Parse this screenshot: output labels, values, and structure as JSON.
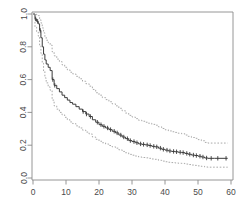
{
  "chart_data": {
    "type": "line",
    "title": "",
    "subtitle": "",
    "xlabel": "",
    "ylabel": "",
    "xlim": [
      0,
      61
    ],
    "ylim": [
      0,
      1.0
    ],
    "grid": false,
    "legend": null,
    "x_ticks": [
      0,
      10,
      20,
      30,
      40,
      50,
      60
    ],
    "x_tick_labels": [
      "0",
      "10",
      "20",
      "30",
      "40",
      "50",
      "60"
    ],
    "y_ticks": [
      0.0,
      0.2,
      0.4,
      0.6,
      0.8,
      1.0
    ],
    "y_tick_labels": [
      "0.0",
      "0.2",
      "0.4",
      "0.6",
      "0.8",
      "1.0"
    ],
    "series": [
      {
        "name": "survival-estimate",
        "style": "step-solid",
        "color": "#3a3a3a",
        "points": [
          [
            0,
            1.0
          ],
          [
            0.6,
            0.97
          ],
          [
            1.1,
            0.955
          ],
          [
            1.6,
            0.94
          ],
          [
            2.0,
            0.9
          ],
          [
            2.4,
            0.855
          ],
          [
            2.8,
            0.8
          ],
          [
            3.2,
            0.755
          ],
          [
            3.6,
            0.72
          ],
          [
            4.0,
            0.695
          ],
          [
            4.6,
            0.675
          ],
          [
            5.2,
            0.655
          ],
          [
            5.8,
            0.6
          ],
          [
            6.4,
            0.565
          ],
          [
            7.2,
            0.545
          ],
          [
            8.0,
            0.525
          ],
          [
            8.8,
            0.505
          ],
          [
            9.6,
            0.49
          ],
          [
            10.4,
            0.475
          ],
          [
            11.2,
            0.46
          ],
          [
            12.0,
            0.45
          ],
          [
            13.0,
            0.435
          ],
          [
            14.0,
            0.42
          ],
          [
            15.0,
            0.405
          ],
          [
            16.0,
            0.39
          ],
          [
            17.0,
            0.375
          ],
          [
            18.0,
            0.355
          ],
          [
            19.0,
            0.34
          ],
          [
            20.0,
            0.325
          ],
          [
            21.0,
            0.315
          ],
          [
            22.0,
            0.305
          ],
          [
            23.0,
            0.295
          ],
          [
            24.0,
            0.285
          ],
          [
            25.0,
            0.275
          ],
          [
            26.0,
            0.262
          ],
          [
            27.0,
            0.25
          ],
          [
            28.0,
            0.24
          ],
          [
            29.0,
            0.228
          ],
          [
            30.0,
            0.222
          ],
          [
            31.0,
            0.215
          ],
          [
            32.0,
            0.208
          ],
          [
            33.0,
            0.205
          ],
          [
            34.0,
            0.202
          ],
          [
            35.0,
            0.198
          ],
          [
            36.0,
            0.193
          ],
          [
            37.0,
            0.19
          ],
          [
            38.0,
            0.182
          ],
          [
            39.0,
            0.175
          ],
          [
            40.0,
            0.17
          ],
          [
            41.0,
            0.165
          ],
          [
            42.0,
            0.162
          ],
          [
            43.0,
            0.16
          ],
          [
            44.0,
            0.157
          ],
          [
            45.0,
            0.155
          ],
          [
            46.0,
            0.15
          ],
          [
            47.0,
            0.145
          ],
          [
            48.0,
            0.14
          ],
          [
            49.0,
            0.137
          ],
          [
            50.0,
            0.133
          ],
          [
            51.0,
            0.128
          ],
          [
            52.0,
            0.122
          ],
          [
            53.0,
            0.12
          ],
          [
            55.0,
            0.12
          ],
          [
            59.0,
            0.12
          ]
        ],
        "censor_points": [
          [
            0.8,
            0.97
          ],
          [
            1.4,
            0.955
          ],
          [
            2.2,
            0.9
          ],
          [
            6.0,
            0.6
          ],
          [
            6.6,
            0.565
          ],
          [
            15.2,
            0.405
          ],
          [
            16.2,
            0.39
          ],
          [
            17.4,
            0.375
          ],
          [
            19.5,
            0.34
          ],
          [
            20.6,
            0.325
          ],
          [
            21.5,
            0.315
          ],
          [
            22.6,
            0.305
          ],
          [
            23.5,
            0.295
          ],
          [
            24.6,
            0.285
          ],
          [
            25.5,
            0.275
          ],
          [
            26.6,
            0.262
          ],
          [
            27.5,
            0.25
          ],
          [
            28.6,
            0.24
          ],
          [
            29.5,
            0.228
          ],
          [
            30.6,
            0.222
          ],
          [
            31.5,
            0.215
          ],
          [
            32.6,
            0.208
          ],
          [
            33.5,
            0.205
          ],
          [
            34.6,
            0.202
          ],
          [
            35.5,
            0.198
          ],
          [
            36.6,
            0.193
          ],
          [
            37.5,
            0.19
          ],
          [
            38.6,
            0.182
          ],
          [
            39.5,
            0.175
          ],
          [
            40.6,
            0.17
          ],
          [
            41.5,
            0.165
          ],
          [
            42.6,
            0.162
          ],
          [
            43.5,
            0.16
          ],
          [
            44.6,
            0.157
          ],
          [
            45.5,
            0.155
          ],
          [
            46.6,
            0.15
          ],
          [
            47.5,
            0.145
          ],
          [
            48.6,
            0.14
          ],
          [
            49.5,
            0.137
          ],
          [
            50.6,
            0.133
          ],
          [
            51.5,
            0.128
          ],
          [
            52.6,
            0.122
          ],
          [
            54.0,
            0.12
          ],
          [
            56.0,
            0.12
          ],
          [
            58.5,
            0.12
          ]
        ]
      },
      {
        "name": "upper-confidence-limit",
        "style": "step-dashed",
        "color": "#9a9a9a",
        "points": [
          [
            0,
            1.0
          ],
          [
            0.6,
            1.0
          ],
          [
            1.1,
            0.995
          ],
          [
            1.6,
            0.99
          ],
          [
            2.0,
            0.965
          ],
          [
            2.4,
            0.945
          ],
          [
            2.8,
            0.915
          ],
          [
            3.2,
            0.885
          ],
          [
            3.6,
            0.86
          ],
          [
            4.0,
            0.84
          ],
          [
            4.6,
            0.825
          ],
          [
            5.2,
            0.81
          ],
          [
            5.8,
            0.77
          ],
          [
            6.4,
            0.745
          ],
          [
            7.2,
            0.725
          ],
          [
            8.0,
            0.71
          ],
          [
            8.8,
            0.69
          ],
          [
            9.6,
            0.675
          ],
          [
            10.4,
            0.66
          ],
          [
            11.2,
            0.645
          ],
          [
            12.0,
            0.635
          ],
          [
            13.0,
            0.62
          ],
          [
            14.0,
            0.605
          ],
          [
            15.0,
            0.59
          ],
          [
            16.0,
            0.575
          ],
          [
            17.0,
            0.56
          ],
          [
            18.0,
            0.54
          ],
          [
            19.0,
            0.52
          ],
          [
            20.0,
            0.505
          ],
          [
            21.0,
            0.49
          ],
          [
            22.0,
            0.478
          ],
          [
            23.0,
            0.465
          ],
          [
            24.0,
            0.452
          ],
          [
            25.0,
            0.44
          ],
          [
            26.0,
            0.425
          ],
          [
            27.0,
            0.41
          ],
          [
            28.0,
            0.396
          ],
          [
            29.0,
            0.382
          ],
          [
            30.0,
            0.372
          ],
          [
            31.0,
            0.362
          ],
          [
            32.0,
            0.352
          ],
          [
            33.0,
            0.346
          ],
          [
            34.0,
            0.34
          ],
          [
            35.0,
            0.334
          ],
          [
            36.0,
            0.327
          ],
          [
            37.0,
            0.322
          ],
          [
            38.0,
            0.312
          ],
          [
            39.0,
            0.302
          ],
          [
            40.0,
            0.294
          ],
          [
            41.0,
            0.287
          ],
          [
            42.0,
            0.282
          ],
          [
            43.0,
            0.278
          ],
          [
            44.0,
            0.273
          ],
          [
            45.0,
            0.27
          ],
          [
            46.0,
            0.262
          ],
          [
            47.0,
            0.254
          ],
          [
            48.0,
            0.247
          ],
          [
            49.0,
            0.242
          ],
          [
            50.0,
            0.234
          ],
          [
            51.0,
            0.227
          ],
          [
            52.0,
            0.217
          ],
          [
            53.0,
            0.213
          ],
          [
            55.0,
            0.213
          ],
          [
            59.0,
            0.213
          ]
        ]
      },
      {
        "name": "lower-confidence-limit",
        "style": "step-dashed",
        "color": "#9a9a9a",
        "points": [
          [
            0,
            1.0
          ],
          [
            0.6,
            0.92
          ],
          [
            1.1,
            0.89
          ],
          [
            1.6,
            0.865
          ],
          [
            2.0,
            0.81
          ],
          [
            2.4,
            0.76
          ],
          [
            2.8,
            0.7
          ],
          [
            3.2,
            0.65
          ],
          [
            3.6,
            0.61
          ],
          [
            4.0,
            0.58
          ],
          [
            4.6,
            0.555
          ],
          [
            5.2,
            0.535
          ],
          [
            5.8,
            0.475
          ],
          [
            6.4,
            0.44
          ],
          [
            7.2,
            0.42
          ],
          [
            8.0,
            0.4
          ],
          [
            8.8,
            0.385
          ],
          [
            9.6,
            0.37
          ],
          [
            10.4,
            0.355
          ],
          [
            11.2,
            0.342
          ],
          [
            12.0,
            0.332
          ],
          [
            13.0,
            0.318
          ],
          [
            14.0,
            0.305
          ],
          [
            15.0,
            0.292
          ],
          [
            16.0,
            0.28
          ],
          [
            17.0,
            0.268
          ],
          [
            18.0,
            0.25
          ],
          [
            19.0,
            0.236
          ],
          [
            20.0,
            0.224
          ],
          [
            21.0,
            0.215
          ],
          [
            22.0,
            0.207
          ],
          [
            23.0,
            0.198
          ],
          [
            24.0,
            0.19
          ],
          [
            25.0,
            0.182
          ],
          [
            26.0,
            0.172
          ],
          [
            27.0,
            0.162
          ],
          [
            28.0,
            0.154
          ],
          [
            29.0,
            0.144
          ],
          [
            30.0,
            0.139
          ],
          [
            31.0,
            0.134
          ],
          [
            32.0,
            0.128
          ],
          [
            33.0,
            0.125
          ],
          [
            34.0,
            0.123
          ],
          [
            35.0,
            0.12
          ],
          [
            36.0,
            0.116
          ],
          [
            37.0,
            0.114
          ],
          [
            38.0,
            0.108
          ],
          [
            39.0,
            0.103
          ],
          [
            40.0,
            0.099
          ],
          [
            41.0,
            0.096
          ],
          [
            42.0,
            0.094
          ],
          [
            43.0,
            0.092
          ],
          [
            44.0,
            0.09
          ],
          [
            45.0,
            0.089
          ],
          [
            46.0,
            0.085
          ],
          [
            47.0,
            0.082
          ],
          [
            48.0,
            0.079
          ],
          [
            49.0,
            0.077
          ],
          [
            50.0,
            0.074
          ],
          [
            51.0,
            0.071
          ],
          [
            52.0,
            0.067
          ],
          [
            53.0,
            0.066
          ],
          [
            55.0,
            0.066
          ],
          [
            59.0,
            0.066
          ]
        ]
      }
    ]
  },
  "plot": {
    "box_color": "#8a8a8a",
    "background": "#ffffff"
  }
}
